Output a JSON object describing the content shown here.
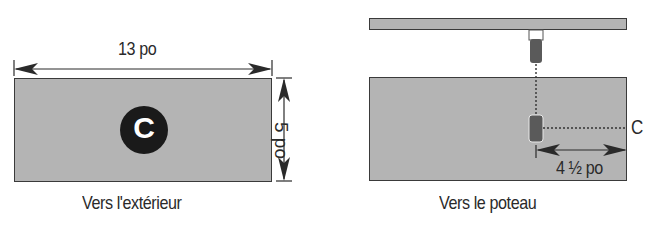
{
  "left_panel": {
    "width_label": "13 po",
    "height_label": "5 po",
    "marker_letter": "C",
    "caption": "Vers l'extérieur"
  },
  "right_panel": {
    "marker_label": "C",
    "offset_label": "4 ½ po",
    "caption": "Vers le poteau"
  },
  "colors": {
    "board_fill": "#b4b4b4",
    "line": "#2a2a2a",
    "marker": "#1a1a1a"
  }
}
